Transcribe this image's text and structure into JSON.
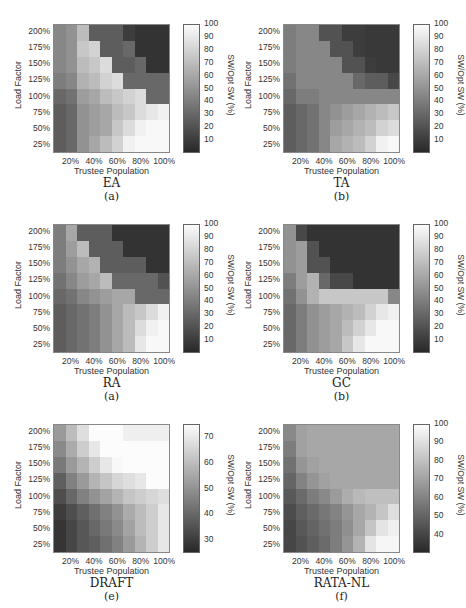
{
  "chart_data": [
    {
      "type": "heatmap",
      "title": "EA",
      "subtitle": "(a)",
      "xlabel": "Trustee Population",
      "ylabel": "Load Factor",
      "colorbar_label": "SW/Opt SW (%)",
      "x_ticks": [
        "20%",
        "40%",
        "60%",
        "80%",
        "100%"
      ],
      "y_ticks": [
        "200%",
        "175%",
        "150%",
        "125%",
        "100%",
        "75%",
        "50%",
        "25%"
      ],
      "colorbar_ticks": [
        100,
        90,
        80,
        70,
        60,
        50,
        40,
        30,
        20,
        10
      ],
      "clim": [
        0,
        100
      ],
      "x": [
        "10%",
        "20%",
        "30%",
        "40%",
        "50%",
        "60%",
        "70%",
        "80%",
        "90%",
        "100%"
      ],
      "y": [
        "200%",
        "175%",
        "150%",
        "125%",
        "100%",
        "75%",
        "50%",
        "25%"
      ],
      "values": [
        [
          45,
          50,
          70,
          25,
          25,
          25,
          10,
          5,
          5,
          5
        ],
        [
          45,
          50,
          75,
          80,
          25,
          25,
          30,
          5,
          5,
          5
        ],
        [
          45,
          50,
          70,
          75,
          85,
          25,
          25,
          30,
          5,
          5
        ],
        [
          40,
          45,
          65,
          70,
          80,
          85,
          30,
          30,
          30,
          30
        ],
        [
          30,
          35,
          55,
          60,
          70,
          75,
          80,
          85,
          30,
          30
        ],
        [
          25,
          30,
          50,
          55,
          60,
          70,
          75,
          85,
          90,
          95
        ],
        [
          25,
          30,
          50,
          55,
          60,
          75,
          85,
          95,
          98,
          98
        ],
        [
          25,
          30,
          50,
          60,
          70,
          80,
          95,
          98,
          98,
          98
        ]
      ]
    },
    {
      "type": "heatmap",
      "title": "TA",
      "subtitle": "(b)",
      "xlabel": "Trustee Population",
      "ylabel": "Load Factor",
      "colorbar_label": "SW/Opt SW (%)",
      "x_ticks": [
        "20%",
        "40%",
        "60%",
        "80%",
        "100%"
      ],
      "y_ticks": [
        "200%",
        "175%",
        "150%",
        "125%",
        "100%",
        "75%",
        "50%",
        "25%"
      ],
      "colorbar_ticks": [
        100,
        90,
        80,
        70,
        60,
        50,
        40,
        30,
        20,
        10
      ],
      "clim": [
        0,
        100
      ],
      "x": [
        "10%",
        "20%",
        "30%",
        "40%",
        "50%",
        "60%",
        "70%",
        "80%",
        "90%",
        "100%"
      ],
      "y": [
        "200%",
        "175%",
        "150%",
        "125%",
        "100%",
        "75%",
        "50%",
        "25%"
      ],
      "values": [
        [
          40,
          45,
          45,
          20,
          20,
          10,
          10,
          8,
          8,
          8
        ],
        [
          40,
          45,
          45,
          45,
          20,
          20,
          10,
          8,
          8,
          8
        ],
        [
          40,
          45,
          45,
          45,
          45,
          20,
          20,
          10,
          8,
          8
        ],
        [
          35,
          45,
          45,
          45,
          45,
          45,
          30,
          25,
          25,
          15
        ],
        [
          30,
          40,
          40,
          45,
          45,
          45,
          45,
          45,
          45,
          45
        ],
        [
          25,
          30,
          35,
          45,
          50,
          55,
          60,
          65,
          70,
          75
        ],
        [
          25,
          30,
          35,
          45,
          55,
          60,
          65,
          70,
          80,
          85
        ],
        [
          25,
          30,
          35,
          45,
          60,
          65,
          70,
          80,
          95,
          98
        ]
      ]
    },
    {
      "type": "heatmap",
      "title": "RA",
      "subtitle": "(a)",
      "xlabel": "Trustee Population",
      "ylabel": "Load Factor",
      "colorbar_label": "SW/Opt SW (%)",
      "x_ticks": [
        "20%",
        "40%",
        "60%",
        "80%",
        "100%"
      ],
      "y_ticks": [
        "200%",
        "175%",
        "150%",
        "125%",
        "100%",
        "75%",
        "50%",
        "25%"
      ],
      "colorbar_ticks": [
        100,
        90,
        80,
        70,
        60,
        50,
        40,
        30,
        20,
        10
      ],
      "clim": [
        0,
        100
      ],
      "x": [
        "10%",
        "20%",
        "30%",
        "40%",
        "50%",
        "60%",
        "70%",
        "80%",
        "90%",
        "100%"
      ],
      "y": [
        "200%",
        "175%",
        "150%",
        "125%",
        "100%",
        "75%",
        "50%",
        "25%"
      ],
      "values": [
        [
          40,
          60,
          25,
          25,
          25,
          5,
          5,
          5,
          5,
          5
        ],
        [
          40,
          55,
          70,
          25,
          25,
          25,
          5,
          5,
          5,
          5
        ],
        [
          40,
          50,
          60,
          65,
          25,
          25,
          25,
          25,
          5,
          5
        ],
        [
          35,
          45,
          55,
          60,
          70,
          30,
          30,
          30,
          30,
          20
        ],
        [
          30,
          35,
          45,
          50,
          55,
          60,
          60,
          30,
          30,
          30
        ],
        [
          25,
          30,
          35,
          40,
          50,
          60,
          70,
          75,
          85,
          95
        ],
        [
          25,
          30,
          35,
          40,
          50,
          60,
          70,
          85,
          95,
          98
        ],
        [
          25,
          30,
          35,
          40,
          50,
          60,
          70,
          90,
          98,
          98
        ]
      ]
    },
    {
      "type": "heatmap",
      "title": "GC",
      "subtitle": "(b)",
      "xlabel": "Trustee Population",
      "ylabel": "Load Factor",
      "colorbar_label": "SW/Opt SW (%)",
      "x_ticks": [
        "20%",
        "40%",
        "60%",
        "80%",
        "100%"
      ],
      "y_ticks": [
        "200%",
        "175%",
        "150%",
        "125%",
        "100%",
        "75%",
        "50%",
        "25%"
      ],
      "colorbar_ticks": [
        100,
        90,
        80,
        70,
        60,
        50,
        40,
        30,
        20,
        10
      ],
      "clim": [
        0,
        100
      ],
      "x": [
        "10%",
        "20%",
        "30%",
        "40%",
        "50%",
        "60%",
        "70%",
        "80%",
        "90%",
        "100%"
      ],
      "y": [
        "200%",
        "175%",
        "150%",
        "125%",
        "100%",
        "75%",
        "50%",
        "25%"
      ],
      "values": [
        [
          50,
          15,
          5,
          5,
          5,
          5,
          5,
          5,
          5,
          5
        ],
        [
          50,
          55,
          20,
          5,
          5,
          5,
          5,
          5,
          5,
          5
        ],
        [
          50,
          55,
          20,
          20,
          5,
          5,
          5,
          5,
          5,
          5
        ],
        [
          40,
          55,
          65,
          30,
          15,
          15,
          5,
          5,
          5,
          5
        ],
        [
          35,
          50,
          65,
          75,
          75,
          75,
          75,
          75,
          75,
          45
        ],
        [
          30,
          40,
          50,
          55,
          60,
          65,
          70,
          80,
          90,
          95
        ],
        [
          30,
          40,
          50,
          55,
          60,
          70,
          80,
          90,
          98,
          98
        ],
        [
          30,
          40,
          50,
          55,
          60,
          75,
          90,
          98,
          98,
          98
        ]
      ]
    },
    {
      "type": "heatmap",
      "title": "DRAFT",
      "subtitle": "(e)",
      "xlabel": "Trustee Population",
      "ylabel": "Load Factor",
      "colorbar_label": "SW/Opt SW (%)",
      "x_ticks": [
        "20%",
        "40%",
        "60%",
        "80%",
        "100%"
      ],
      "y_ticks": [
        "200%",
        "175%",
        "150%",
        "125%",
        "100%",
        "75%",
        "50%",
        "25%"
      ],
      "colorbar_ticks": [
        70,
        60,
        50,
        40,
        30
      ],
      "clim": [
        25,
        75
      ],
      "x": [
        "10%",
        "20%",
        "30%",
        "40%",
        "50%",
        "60%",
        "70%",
        "80%",
        "90%",
        "100%"
      ],
      "y": [
        "200%",
        "175%",
        "150%",
        "125%",
        "100%",
        "75%",
        "50%",
        "25%"
      ],
      "values": [
        [
          52,
          60,
          68,
          75,
          75,
          75,
          72,
          72,
          72,
          72
        ],
        [
          48,
          56,
          64,
          70,
          75,
          75,
          75,
          75,
          75,
          75
        ],
        [
          44,
          52,
          58,
          64,
          70,
          74,
          75,
          75,
          75,
          75
        ],
        [
          38,
          46,
          52,
          58,
          62,
          66,
          68,
          70,
          75,
          75
        ],
        [
          34,
          40,
          46,
          50,
          54,
          58,
          62,
          64,
          66,
          68
        ],
        [
          30,
          34,
          38,
          42,
          46,
          50,
          56,
          60,
          64,
          70
        ],
        [
          28,
          32,
          36,
          40,
          44,
          48,
          54,
          60,
          64,
          70
        ],
        [
          28,
          32,
          36,
          38,
          42,
          46,
          52,
          58,
          64,
          70
        ]
      ]
    },
    {
      "type": "heatmap",
      "title": "RATA-NL",
      "subtitle": "(f)",
      "xlabel": "Trustee Population",
      "ylabel": "Load Factor",
      "colorbar_label": "SW/Opt SW (%)",
      "x_ticks": [
        "20%",
        "40%",
        "60%",
        "80%",
        "100%"
      ],
      "y_ticks": [
        "200%",
        "175%",
        "150%",
        "125%",
        "100%",
        "75%",
        "50%",
        "25%"
      ],
      "colorbar_ticks": [
        100,
        90,
        80,
        70,
        60,
        50,
        40
      ],
      "clim": [
        30,
        100
      ],
      "x": [
        "10%",
        "20%",
        "30%",
        "40%",
        "50%",
        "60%",
        "70%",
        "80%",
        "90%",
        "100%"
      ],
      "y": [
        "200%",
        "175%",
        "150%",
        "125%",
        "100%",
        "75%",
        "50%",
        "25%"
      ],
      "values": [
        [
          62,
          70,
          72,
          72,
          72,
          72,
          72,
          72,
          72,
          72
        ],
        [
          58,
          70,
          72,
          72,
          72,
          72,
          72,
          72,
          72,
          72
        ],
        [
          54,
          66,
          70,
          72,
          72,
          72,
          72,
          72,
          72,
          72
        ],
        [
          50,
          60,
          66,
          70,
          72,
          72,
          72,
          72,
          72,
          72
        ],
        [
          46,
          52,
          58,
          62,
          68,
          74,
          78,
          80,
          80,
          80
        ],
        [
          42,
          48,
          52,
          56,
          60,
          66,
          72,
          76,
          82,
          90
        ],
        [
          40,
          46,
          50,
          54,
          58,
          64,
          72,
          82,
          92,
          96
        ],
        [
          40,
          44,
          48,
          52,
          58,
          66,
          76,
          92,
          98,
          98
        ]
      ]
    }
  ],
  "panels": [
    {
      "title": "EA",
      "subtitle": "(a)"
    },
    {
      "title": "TA",
      "subtitle": "(b)"
    },
    {
      "title": "RA",
      "subtitle": "(a)"
    },
    {
      "title": "GC",
      "subtitle": "(b)"
    },
    {
      "title": "DRAFT",
      "subtitle": "(e)"
    },
    {
      "title": "RATA-NL",
      "subtitle": "(f)"
    }
  ],
  "common": {
    "xlabel": "Trustee Population",
    "ylabel": "Load Factor",
    "colorbar_label": "SW/Opt SW (%)",
    "x_ticks": [
      "20%",
      "40%",
      "60%",
      "80%",
      "100%"
    ],
    "y_ticks": [
      "200%",
      "175%",
      "150%",
      "125%",
      "100%",
      "75%",
      "50%",
      "25%"
    ]
  }
}
